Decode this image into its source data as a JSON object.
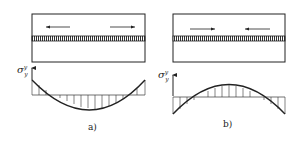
{
  "panels": [
    {
      "id": "a",
      "caption": "a)",
      "axis_label": "σ",
      "axis_sup": "y",
      "axis_sub": "y",
      "arrows": [
        "left",
        "right"
      ],
      "arrow_meaning": "outward (tension)",
      "distribution": "concave-up: positive at ends, negative in middle"
    },
    {
      "id": "b",
      "caption": "b)",
      "axis_label": "σ",
      "axis_sup": "y",
      "axis_sub": "y",
      "arrows": [
        "right",
        "left"
      ],
      "arrow_meaning": "inward (compression)",
      "distribution": "concave-down: negative at ends, positive in middle"
    }
  ],
  "colors": {
    "line": "#222222",
    "hatch": "#333333",
    "background": "#ffffff"
  }
}
